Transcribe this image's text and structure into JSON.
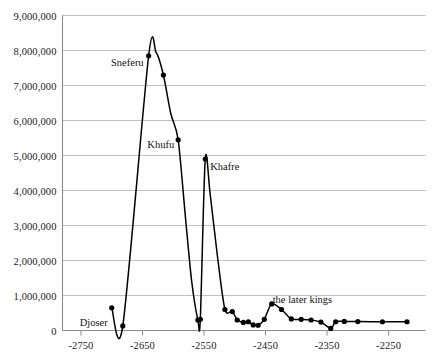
{
  "chart_data": {
    "type": "line",
    "title": "",
    "xlabel": "",
    "ylabel": "",
    "grid": true,
    "legend": "none",
    "xlim": [
      -2780,
      -2190
    ],
    "ylim": [
      0,
      9000000
    ],
    "ytick_labels": [
      "9,000,000",
      "8,000,000",
      "7,000,000",
      "6,000,000",
      "5,000,000",
      "4,000,000",
      "3,000,000",
      "2,000,000",
      "1,000,000",
      "0"
    ],
    "ytick_values": [
      9000000,
      8000000,
      7000000,
      6000000,
      5000000,
      4000000,
      3000000,
      2000000,
      1000000,
      0
    ],
    "xtick_labels": [
      "-2750",
      "-2650",
      "-2550",
      "-2450",
      "-2350",
      "-2250"
    ],
    "xtick_values": [
      -2750,
      -2650,
      -2550,
      -2450,
      -2350,
      -2250
    ],
    "series": [
      {
        "name": "pyramid volume",
        "x": [
          -2700,
          -2682,
          -2640,
          -2628,
          -2616,
          -2604,
          -2592,
          -2580,
          -2570,
          -2560,
          -2556,
          -2548,
          -2540,
          -2528,
          -2516,
          -2504,
          -2496,
          -2486,
          -2478,
          -2470,
          -2462,
          -2452,
          -2440,
          -2424,
          -2408,
          -2392,
          -2376,
          -2360,
          -2344,
          -2336,
          -2322,
          -2300,
          -2260,
          -2220
        ],
        "y": [
          650000,
          130000,
          7850000,
          7950000,
          7300000,
          6200000,
          5450000,
          3200000,
          1400000,
          300000,
          320000,
          4900000,
          3900000,
          2100000,
          600000,
          540000,
          300000,
          230000,
          250000,
          160000,
          150000,
          320000,
          760000,
          600000,
          330000,
          320000,
          300000,
          240000,
          60000,
          250000,
          260000,
          255000,
          250000,
          250000
        ]
      }
    ],
    "point_labels": [
      {
        "text": "Djoser",
        "x": -2700,
        "y": 650000
      },
      {
        "text": "Sneferu",
        "x": -2640,
        "y": 7850000
      },
      {
        "text": "Khufu",
        "x": -2592,
        "y": 5450000
      },
      {
        "text": "Khafre",
        "x": -2548,
        "y": 4900000
      }
    ],
    "annotations": [
      {
        "text": "the later kings",
        "x": -2390,
        "y": 900000
      }
    ],
    "colors": {
      "line": "#000000",
      "marker": "#000000",
      "grid": "#b9b9b9",
      "axis": "#8c8c8c",
      "text": "#111111",
      "background": "#ffffff"
    }
  }
}
